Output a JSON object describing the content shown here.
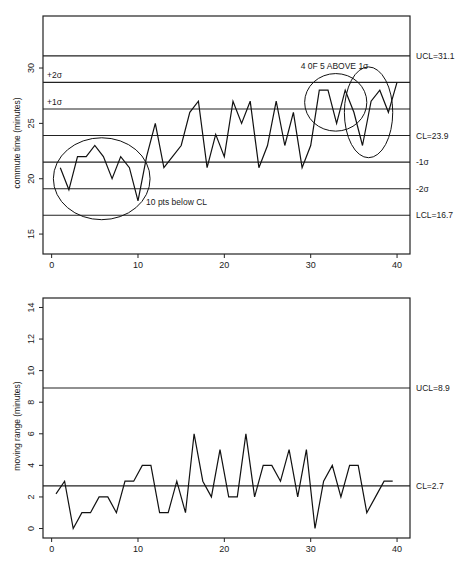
{
  "chart_data": [
    {
      "type": "line",
      "title": "",
      "xlabel": "",
      "ylabel": "commute time (minutes)",
      "xlim": [
        -1,
        41.5
      ],
      "ylim": [
        13.2,
        34.7
      ],
      "x_ticks": [
        0,
        10,
        20,
        30,
        40
      ],
      "y_ticks": [
        15,
        20,
        25,
        30
      ],
      "grid": false,
      "x": [
        1,
        2,
        3,
        4,
        5,
        6,
        7,
        8,
        9,
        10,
        11,
        12,
        13,
        14,
        15,
        16,
        17,
        18,
        19,
        20,
        21,
        22,
        23,
        24,
        25,
        26,
        27,
        28,
        29,
        30,
        31,
        32,
        33,
        34,
        35,
        36,
        37,
        38,
        39,
        40
      ],
      "values": [
        21,
        19,
        22,
        22,
        23,
        22,
        20,
        22,
        21,
        18,
        22,
        25,
        21,
        22,
        23,
        26,
        27,
        21,
        24,
        22,
        27,
        25,
        27,
        21,
        23,
        27,
        23,
        26,
        21,
        23,
        28,
        28,
        25,
        28,
        26,
        23,
        27,
        28,
        26,
        28.7
      ],
      "control_lines": [
        {
          "name": "UCL",
          "value": 31.1,
          "label": "UCL=31.1",
          "side": "right"
        },
        {
          "name": "+2σ",
          "value": 28.7,
          "label": "+2σ",
          "side": "left"
        },
        {
          "name": "+1σ",
          "value": 26.3,
          "label": "+1σ",
          "side": "left"
        },
        {
          "name": "CL",
          "value": 23.9,
          "label": "CL=23.9",
          "side": "right"
        },
        {
          "name": "-1σ",
          "value": 21.5,
          "label": "-1σ",
          "side": "right"
        },
        {
          "name": "-2σ",
          "value": 19.1,
          "label": "-2σ",
          "side": "right"
        },
        {
          "name": "LCL",
          "value": 16.7,
          "label": "LCL=16.7",
          "side": "right"
        }
      ],
      "annotations": [
        {
          "text": "10 pts below CL",
          "type": "ellipse",
          "cx": 5.8,
          "cy": 20.0,
          "rx": 5.6,
          "ry": 3.7
        },
        {
          "text": "4 0F 5 ABOVE 1σ",
          "type": "ellipse",
          "cx": 32.9,
          "cy": 26.9,
          "rx": 3.6,
          "ry": 2.6
        },
        {
          "text": "",
          "type": "ellipse",
          "cx": 36.7,
          "cy": 26.0,
          "rx": 2.8,
          "ry": 4.1
        }
      ]
    },
    {
      "type": "line",
      "title": "",
      "xlabel": "",
      "ylabel": "moving range (minutes)",
      "xlim": [
        -1,
        41.5
      ],
      "ylim": [
        -0.6,
        14.6
      ],
      "x_ticks": [
        0,
        10,
        20,
        30,
        40
      ],
      "y_ticks": [
        0,
        2,
        4,
        6,
        8,
        10,
        12,
        14
      ],
      "grid": false,
      "x": [
        0.5,
        1.5,
        2.5,
        3.5,
        4.5,
        5.5,
        6.5,
        7.5,
        8.5,
        9.5,
        10.5,
        11.5,
        12.5,
        13.5,
        14.5,
        15.5,
        16.5,
        17.5,
        18.5,
        19.5,
        20.5,
        21.5,
        22.5,
        23.5,
        24.5,
        25.5,
        26.5,
        27.5,
        28.5,
        29.5,
        30.5,
        31.5,
        32.5,
        33.5,
        34.5,
        35.5,
        36.5,
        37.5,
        38.5,
        39.5
      ],
      "values": [
        2.2,
        3,
        0,
        1,
        1,
        2,
        2,
        1,
        3,
        3,
        4,
        4,
        1,
        1,
        3,
        1,
        6,
        3,
        2,
        5,
        2,
        2,
        6,
        2,
        4,
        4,
        3,
        5,
        2,
        5,
        0,
        3,
        4,
        2,
        4,
        4,
        1,
        2,
        3,
        3
      ],
      "control_lines": [
        {
          "name": "UCL",
          "value": 8.9,
          "label": "UCL=8.9",
          "side": "right"
        },
        {
          "name": "CL",
          "value": 2.7,
          "label": "CL=2.7",
          "side": "right"
        }
      ]
    }
  ]
}
